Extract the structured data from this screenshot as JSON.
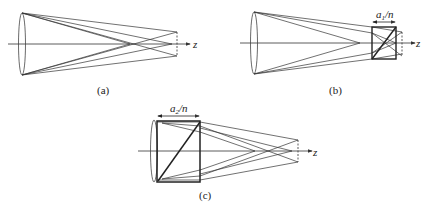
{
  "panels": [
    {
      "id": "a",
      "caption": "(a)",
      "axis_label": "z"
    },
    {
      "id": "b",
      "caption": "(b)",
      "axis_label": "z",
      "slab_width_label_var": "a",
      "slab_width_label_sub": "1",
      "slab_width_label_div": "/n"
    },
    {
      "id": "c",
      "caption": "(c)",
      "axis_label": "z",
      "slab_width_label_var": "a",
      "slab_width_label_sub": "2",
      "slab_width_label_div": "/n"
    }
  ],
  "colors": {
    "line": "#333333",
    "thick": "#222222",
    "background": "#ffffff"
  }
}
